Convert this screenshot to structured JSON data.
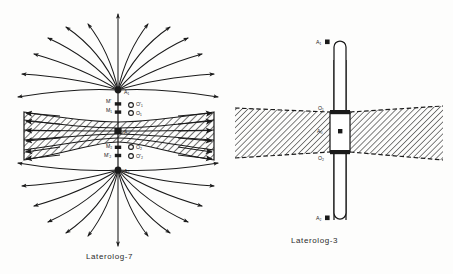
{
  "figure": {
    "kind": "line-diagram",
    "background_color": "#fdfdfc",
    "ink_color": "#1a1a1a"
  },
  "panels": [
    {
      "id": "laterolog-7",
      "caption": "Laterolog-7",
      "caption_x": 86,
      "caption_y": 252,
      "center_x": 118,
      "electrodes": [
        {
          "label": "A₁",
          "name": "upper-current-electrode",
          "x": 118,
          "y": 90,
          "label_dx": 6,
          "label_dy": 4
        },
        {
          "label": "M'",
          "name": "upper-outer-monitor-electrode",
          "x": 118,
          "y": 104,
          "label_dx": -12,
          "label_dy": -1
        },
        {
          "label": "M₁",
          "name": "upper-inner-monitor-electrode",
          "x": 118,
          "y": 112,
          "label_dx": -12,
          "label_dy": 0
        },
        {
          "label": "A₀",
          "name": "main-current-electrode",
          "x": 118,
          "y": 131,
          "label_dx": 6,
          "label_dy": 3
        },
        {
          "label": "M₂",
          "name": "lower-inner-monitor-electrode",
          "x": 118,
          "y": 148,
          "label_dx": -12,
          "label_dy": 0
        },
        {
          "label": "M'₂",
          "name": "lower-outer-monitor-electrode",
          "x": 118,
          "y": 156,
          "label_dx": -14,
          "label_dy": 1
        },
        {
          "label": "A₂",
          "name": "lower-current-electrode",
          "x": 118,
          "y": 170,
          "label_dx": 6,
          "label_dy": 3
        }
      ],
      "monitor_rings": [
        {
          "label": "O'₁",
          "name": "upper-monitor-ring",
          "x": 131,
          "y": 105,
          "label_dx": 5,
          "label_dy": 1
        },
        {
          "label": "O₁",
          "name": "upper-ring",
          "x": 131,
          "y": 113,
          "label_dx": 5,
          "label_dy": 1
        },
        {
          "label": "O₂",
          "name": "lower-ring",
          "x": 131,
          "y": 147,
          "label_dx": 5,
          "label_dy": 1
        },
        {
          "label": "O'₂",
          "name": "lower-monitor-ring",
          "x": 131,
          "y": 156,
          "label_dx": 5,
          "label_dy": 1
        }
      ],
      "beam": {
        "name": "focused-current-beam",
        "left_x": 24,
        "right_x": 214,
        "left_top": 112,
        "left_bottom": 160,
        "waist_top": 122,
        "waist_bottom": 142,
        "stripes": 5,
        "hatch_angle": 45
      },
      "fan": {
        "name": "radial-current-lines",
        "upper_origin_y": 90,
        "lower_origin_y": 170,
        "ray_count": 13,
        "radius_x": 98,
        "radius_y": 86
      }
    },
    {
      "id": "laterolog-3",
      "caption": "Laterolog-3",
      "caption_x": 291,
      "caption_y": 236,
      "center_x": 339,
      "electrodes": [
        {
          "label": "A₁",
          "name": "upper-guard-electrode",
          "x": 332,
          "y": 42,
          "label_dx": -12,
          "label_dy": 0
        },
        {
          "label": "O₁",
          "name": "upper-gap-ring",
          "x": 332,
          "y": 110,
          "label_dx": -12,
          "label_dy": -1
        },
        {
          "label": "A₀",
          "name": "center-current-electrode",
          "x": 332,
          "y": 131,
          "label_dx": -13,
          "label_dy": 0
        },
        {
          "label": "O₂",
          "name": "lower-gap-ring",
          "x": 332,
          "y": 152,
          "label_dx": -12,
          "label_dy": 2
        },
        {
          "label": "A₂",
          "name": "lower-guard-electrode",
          "x": 332,
          "y": 218,
          "label_dx": -12,
          "label_dy": 0
        }
      ],
      "tool": {
        "name": "sonde-body",
        "x": 334,
        "width": 12,
        "top": 40,
        "bottom": 220,
        "cap_radius": 6,
        "center_block_top": 112,
        "center_block_bottom": 152,
        "center_block_width": 20
      },
      "beds": [
        {
          "name": "left-hatched-bed",
          "x_outer": 235,
          "x_inner": 330,
          "outer_top": 108,
          "outer_bottom": 158,
          "inner_top": 112,
          "inner_bottom": 152
        },
        {
          "name": "right-hatched-bed",
          "x_inner": 350,
          "x_outer": 443,
          "inner_top": 112,
          "inner_bottom": 152,
          "outer_top": 106,
          "outer_bottom": 160
        }
      ]
    }
  ]
}
